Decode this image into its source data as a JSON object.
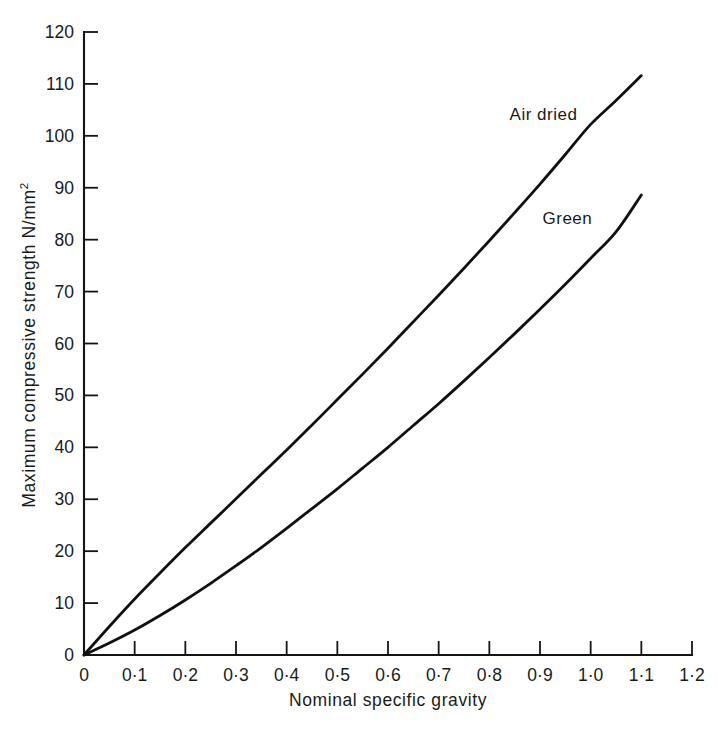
{
  "chart_data": {
    "type": "line",
    "title": "",
    "xlabel": "Nominal specific gravity",
    "ylabel": "Maximum compressive strength N/mm",
    "ylabel_superscript": "2",
    "xlim": [
      0,
      1.2
    ],
    "ylim": [
      0,
      120
    ],
    "grid": false,
    "legend_position": "inline-annotation",
    "x_ticks": [
      0,
      0.1,
      0.2,
      0.3,
      0.4,
      0.5,
      0.6,
      0.7,
      0.8,
      0.9,
      1.0,
      1.1,
      1.2
    ],
    "x_tick_labels": [
      "0",
      "0·1",
      "0·2",
      "0·3",
      "0·4",
      "0·5",
      "0·6",
      "0·7",
      "0·8",
      "0·9",
      "1·0",
      "1·1",
      "1·2"
    ],
    "y_ticks": [
      0,
      10,
      20,
      30,
      40,
      50,
      60,
      70,
      80,
      90,
      100,
      110,
      120
    ],
    "y_tick_labels": [
      "0",
      "10",
      "20",
      "30",
      "40",
      "50",
      "60",
      "70",
      "80",
      "90",
      "100",
      "110",
      "120"
    ],
    "series": [
      {
        "name": "Air dried",
        "label_x": 0.84,
        "label_y": 103,
        "x": [
          0.0,
          0.05,
          0.1,
          0.15,
          0.2,
          0.25,
          0.3,
          0.35,
          0.4,
          0.45,
          0.5,
          0.55,
          0.6,
          0.65,
          0.7,
          0.75,
          0.8,
          0.85,
          0.9,
          0.95,
          1.0,
          1.05,
          1.1
        ],
        "y": [
          0.0,
          5.5,
          10.8,
          15.8,
          20.7,
          25.4,
          30.1,
          34.8,
          39.5,
          44.3,
          49.2,
          54.1,
          59.1,
          64.2,
          69.3,
          74.5,
          79.8,
          85.2,
          90.7,
          96.4,
          102.2,
          106.8,
          111.6
        ]
      },
      {
        "name": "Green",
        "label_x": 0.905,
        "label_y": 83,
        "x": [
          0.0,
          0.05,
          0.1,
          0.15,
          0.2,
          0.25,
          0.3,
          0.35,
          0.4,
          0.45,
          0.5,
          0.55,
          0.6,
          0.65,
          0.7,
          0.75,
          0.8,
          0.85,
          0.9,
          0.95,
          1.0,
          1.05,
          1.1
        ],
        "y": [
          0.0,
          2.3,
          4.8,
          7.6,
          10.6,
          13.8,
          17.2,
          20.7,
          24.4,
          28.2,
          32.0,
          36.0,
          40.0,
          44.2,
          48.4,
          52.8,
          57.3,
          61.9,
          66.6,
          71.4,
          76.4,
          81.5,
          88.6
        ]
      }
    ]
  }
}
